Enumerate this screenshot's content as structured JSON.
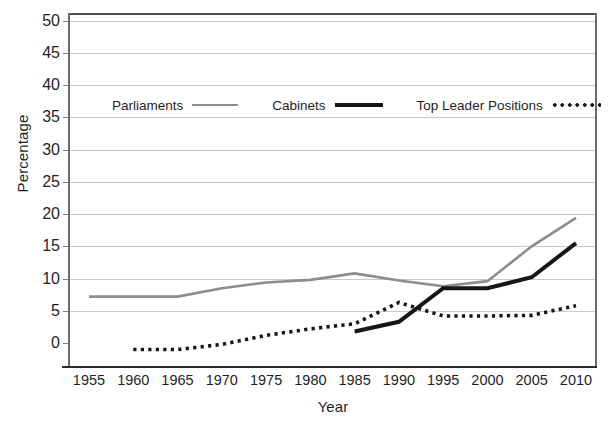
{
  "chart_data": {
    "type": "line",
    "title": "",
    "xlabel": "Year",
    "ylabel": "Percentage",
    "x": [
      1955,
      1960,
      1965,
      1970,
      1975,
      1980,
      1985,
      1990,
      1995,
      2000,
      2005,
      2010
    ],
    "xlim": [
      1955,
      2010
    ],
    "ylim": [
      -2,
      51
    ],
    "y_ticks": [
      0,
      5,
      10,
      15,
      20,
      25,
      30,
      35,
      40,
      45,
      50
    ],
    "x_ticks": [
      "1955",
      "1960",
      "1965",
      "1970",
      "1975",
      "1980",
      "1985",
      "1990",
      "1995",
      "2000",
      "2005",
      "2010"
    ],
    "grid": "horizontal",
    "legend_position": "upper-left-inside",
    "series": [
      {
        "name": "Parliaments",
        "style": "solid",
        "color": "#8d8d8d",
        "width": 2.6,
        "x": [
          1955,
          1960,
          1965,
          1970,
          1975,
          1980,
          1985,
          1990,
          1995,
          2000,
          2005,
          2010
        ],
        "values": [
          7.2,
          7.2,
          7.2,
          8.5,
          9.4,
          9.8,
          10.8,
          9.7,
          8.8,
          9.6,
          15.0,
          19.4
        ]
      },
      {
        "name": "Cabinets",
        "style": "solid",
        "color": "#161616",
        "width": 4.0,
        "x": [
          1985,
          1990,
          1995,
          2000,
          2005,
          2010
        ],
        "values": [
          1.8,
          3.3,
          8.5,
          8.5,
          10.2,
          15.5
        ]
      },
      {
        "name": "Top Leader Positions",
        "style": "dotted",
        "color": "#161616",
        "width": 3.6,
        "x": [
          1960,
          1965,
          1970,
          1975,
          1980,
          1985,
          1990,
          1995,
          2000,
          2005,
          2010
        ],
        "values": [
          -1.0,
          -1.0,
          -0.2,
          1.2,
          2.2,
          3.0,
          6.3,
          4.2,
          4.2,
          4.3,
          5.8
        ]
      }
    ]
  },
  "axes": {
    "y_title": "Percentage",
    "x_title": "Year"
  },
  "legend": {
    "items": [
      {
        "label": "Parliaments",
        "swatch": "gray-solid-line-swatch"
      },
      {
        "label": "Cabinets",
        "swatch": "black-thick-solid-line-swatch"
      },
      {
        "label": "Top Leader Positions",
        "swatch": "black-dotted-line-swatch"
      }
    ]
  },
  "colors": {
    "parliaments": "#8d8d8d",
    "cabinets": "#161616",
    "top_leader_positions": "#161616",
    "gridline": "#c9c9c9",
    "axis": "#2b2b2b",
    "background": "#ffffff"
  }
}
